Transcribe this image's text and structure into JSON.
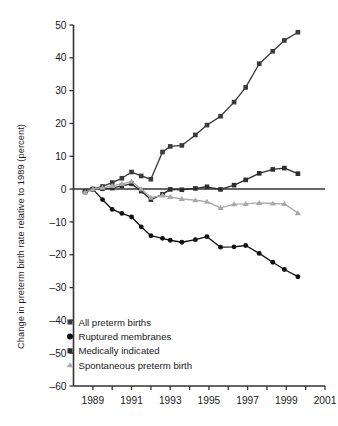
{
  "chart_data": {
    "type": "line",
    "title": "",
    "xlabel": "",
    "ylabel": "Change in preterm birth rate relative to 1989 (percent)",
    "xlim": [
      1988,
      2001
    ],
    "ylim": [
      -60,
      50
    ],
    "xticks": [
      "1989",
      "1991",
      "1993",
      "1995",
      "1997",
      "1999",
      "2001"
    ],
    "xtick_values": [
      1989,
      1991,
      1993,
      1995,
      1997,
      1999,
      2001
    ],
    "yticks": [
      "50",
      "40",
      "30",
      "20",
      "10",
      "0",
      "–10",
      "–20",
      "–30",
      "–40",
      "–50",
      "–60"
    ],
    "ytick_values": [
      50,
      40,
      30,
      20,
      10,
      0,
      -10,
      -20,
      -30,
      -40,
      -50,
      -60
    ],
    "grid": false,
    "legend_position": "lower-left-inside",
    "zero_line": true,
    "x": [
      1988.6,
      1989,
      1989.5,
      1990,
      1990.5,
      1991,
      1991.5,
      1992,
      1992.6,
      1993,
      1993.6,
      1994.3,
      1994.9,
      1995.6,
      1996.3,
      1996.9,
      1997.6,
      1998.3,
      1998.9,
      1999.6
    ],
    "series": [
      {
        "name": "All preterm births",
        "marker": "square",
        "color": "#3a3a3a",
        "values": [
          -0.7,
          0.0,
          0.8,
          2.0,
          3.3,
          5.2,
          4.0,
          3.0,
          11.3,
          13.0,
          13.3,
          16.5,
          19.5,
          22.2,
          26.5,
          31.0,
          38.2,
          42.0,
          45.3,
          47.8
        ]
      },
      {
        "name": "Ruptured membranes",
        "marker": "circle",
        "color": "#111111",
        "values": [
          -0.8,
          0.0,
          -3.2,
          -6.2,
          -7.4,
          -8.5,
          -11.5,
          -14.2,
          -15.0,
          -15.6,
          -16.2,
          -15.4,
          -14.5,
          -17.7,
          -17.6,
          -17.2,
          -19.6,
          -22.3,
          -24.5,
          -26.7
        ]
      },
      {
        "name": "Medically indicated",
        "marker": "square",
        "color": "#2e2e2e",
        "values": [
          -0.9,
          0.0,
          0.1,
          0.3,
          1.0,
          1.6,
          -0.6,
          -3.2,
          -1.6,
          -0.1,
          -0.2,
          0.2,
          0.7,
          -0.1,
          1.2,
          2.8,
          4.8,
          6.0,
          6.4,
          4.7
        ]
      },
      {
        "name": "Spontaneous preterm birth",
        "marker": "triangle",
        "color": "#a8a8a8",
        "values": [
          -0.9,
          0.0,
          0.4,
          1.0,
          1.6,
          2.3,
          0.0,
          -2.6,
          -1.9,
          -2.4,
          -3.0,
          -3.4,
          -3.8,
          -5.7,
          -4.6,
          -4.5,
          -4.2,
          -4.4,
          -4.5,
          -7.3
        ]
      }
    ]
  },
  "legend": {
    "items": [
      {
        "label": "All preterm births",
        "marker": "square",
        "color": "#3a3a3a"
      },
      {
        "label": "Ruptured membranes",
        "marker": "circle",
        "color": "#111111"
      },
      {
        "label": "Medically indicated",
        "marker": "square",
        "color": "#2e2e2e"
      },
      {
        "label": "Spontaneous preterm birth",
        "marker": "triangle",
        "color": "#a8a8a8"
      }
    ]
  },
  "colors": {
    "axis": "#333333",
    "background": "#ffffff",
    "text": "#1a1a1a"
  }
}
